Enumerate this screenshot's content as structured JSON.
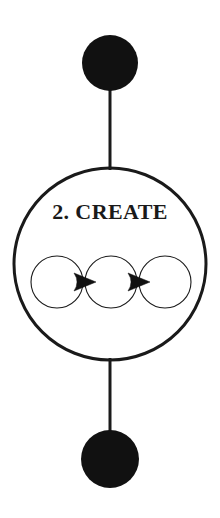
{
  "diagram": {
    "title_text": "2. CREATE",
    "background_color": "#ffffff",
    "stroke_color": "#1a1a1a",
    "fill_color": "#111111",
    "nodes": {
      "top_terminal": {
        "name": "top-filled-circle",
        "shape": "filled-circle",
        "cx": 110,
        "cy": 63,
        "r": 28,
        "fill": "#111111"
      },
      "main_stage": {
        "name": "main-stage-circle",
        "shape": "outlined-circle",
        "cx": 110,
        "cy": 264,
        "r": 96,
        "stroke": "#1a1a1a",
        "stroke_width": 3,
        "label": "2. CREATE",
        "label_x": 110,
        "label_y": 219,
        "label_font_size": 22
      },
      "bottom_terminal": {
        "name": "bottom-filled-circle",
        "shape": "filled-circle",
        "cx": 110,
        "cy": 459,
        "r": 29,
        "fill": "#111111"
      }
    },
    "connectors": [
      {
        "name": "top-connector-line",
        "x1": 110,
        "y1": 90,
        "x2": 110,
        "y2": 170,
        "width": 3
      },
      {
        "name": "bottom-connector-line",
        "x1": 110,
        "y1": 358,
        "x2": 110,
        "y2": 432,
        "width": 3
      }
    ],
    "inner_sequence": {
      "name": "inner-circle-sequence",
      "circle_radius": 26,
      "circle_stroke_width": 1.1,
      "circle_cy": 282,
      "circles": [
        {
          "name": "inner-circle-1",
          "cx": 57
        },
        {
          "name": "inner-circle-2",
          "cx": 111
        },
        {
          "name": "inner-circle-3",
          "cx": 165
        }
      ],
      "arrows": [
        {
          "name": "arrow-1",
          "cx": 85,
          "cy": 282
        },
        {
          "name": "arrow-2",
          "cx": 139,
          "cy": 282
        }
      ],
      "arrow_half_width": 11,
      "arrow_half_height": 9
    }
  }
}
